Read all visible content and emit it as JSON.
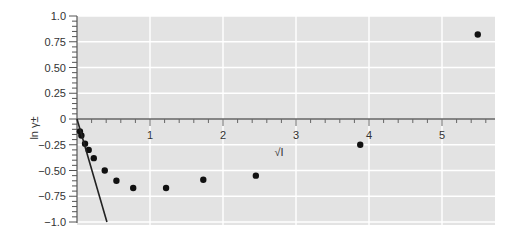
{
  "chart_data": {
    "type": "scatter",
    "title": "",
    "xlabel": "√I",
    "ylabel": "ln γ±",
    "xlim": [
      0,
      5.6
    ],
    "ylim": [
      -1.0,
      1.0
    ],
    "grid": true,
    "background": "#e3e3e3",
    "x_ticks": [
      1,
      2,
      3,
      4,
      5
    ],
    "x_tick_labels": [
      "1",
      "2",
      "3",
      "4",
      "5"
    ],
    "y_ticks": [
      1.0,
      0.75,
      0.5,
      0.25,
      0,
      -0.25,
      -0.5,
      -0.75,
      -1.0
    ],
    "y_tick_labels": [
      "1.0",
      "0.75",
      "0.50",
      "0.25",
      "0",
      "−0.25",
      "−0.50",
      "−0.75",
      "−1.0"
    ],
    "series": [
      {
        "name": "experimental",
        "type": "scatter",
        "color": "#111111",
        "x": [
          0.04,
          0.06,
          0.11,
          0.16,
          0.23,
          0.38,
          0.54,
          0.77,
          1.22,
          1.73,
          2.45,
          3.88,
          5.49
        ],
        "y": [
          -0.12,
          -0.16,
          -0.24,
          -0.3,
          -0.38,
          -0.5,
          -0.6,
          -0.67,
          -0.67,
          -0.59,
          -0.55,
          -0.25,
          0.82
        ]
      },
      {
        "name": "Debye-Hückel limiting law",
        "type": "line",
        "color": "#222222",
        "x": [
          0,
          0.41
        ],
        "y": [
          0,
          -1.0
        ]
      }
    ]
  }
}
